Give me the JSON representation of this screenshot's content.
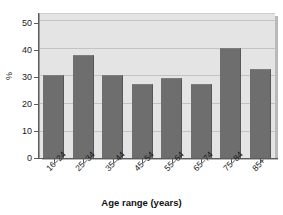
{
  "chart_data": {
    "type": "bar",
    "title": "",
    "subtitle": "",
    "xlabel": "Age range (years)",
    "ylabel": "%",
    "categories": [
      "16–24",
      "25–34",
      "35–44",
      "45–54",
      "55–64",
      "65–74",
      "75–84",
      "85+"
    ],
    "values": [
      29.8,
      36.8,
      29.8,
      26.5,
      28.6,
      26.6,
      39.6,
      32.1
    ],
    "series": [
      {
        "name": "percent",
        "values": [
          29.8,
          36.8,
          29.8,
          26.5,
          28.6,
          26.6,
          39.6,
          32.1
        ]
      }
    ],
    "ylim": [
      0,
      52
    ],
    "yticks": [
      0,
      10,
      20,
      30,
      40,
      50
    ],
    "ytick_labels": [
      "0",
      "10",
      "20",
      "30",
      "40",
      "50"
    ],
    "grid": "horizontal",
    "legend": "none",
    "bar_color": "#6e6e6e",
    "plot_background": "#e4e4e4",
    "gridline_color": "#c3c3c3",
    "axis_color": "#5b5b5b",
    "figure_background": "#ffffff"
  }
}
